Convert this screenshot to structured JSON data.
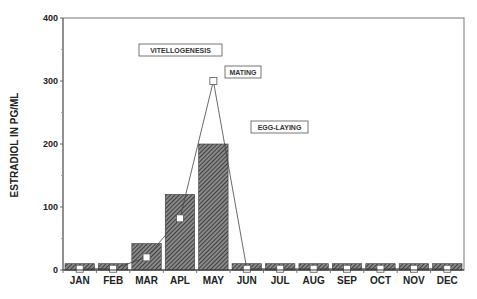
{
  "chart_data": {
    "type": "bar",
    "title": "",
    "xlabel": "",
    "ylabel": "ESTRADIOL IN PG/ML",
    "ylim": [
      0,
      400
    ],
    "yticks": [
      0,
      100,
      200,
      300,
      400
    ],
    "grid": false,
    "categories": [
      "JAN",
      "FEB",
      "MAR",
      "APL",
      "MAY",
      "JUN",
      "JUL",
      "AUG",
      "SEP",
      "OCT",
      "NOV",
      "DEC"
    ],
    "series": [
      {
        "name": "bars (hatched)",
        "type": "bar",
        "values": [
          10,
          10,
          42,
          120,
          200,
          10,
          10,
          10,
          10,
          10,
          10,
          10
        ]
      },
      {
        "name": "line with open squares",
        "type": "line",
        "values": [
          2,
          2,
          20,
          82,
          300,
          2,
          2,
          2,
          2,
          2,
          2,
          2
        ]
      }
    ],
    "annotations": [
      {
        "text": "VITELLOGENESIS",
        "near": "MAR-APL",
        "y": 350
      },
      {
        "text": "MATING",
        "near": "MAY-JUN",
        "y": 308
      },
      {
        "text": "EGG-LAYING",
        "near": "JUN-JUL",
        "y": 226
      }
    ],
    "legend": null
  }
}
